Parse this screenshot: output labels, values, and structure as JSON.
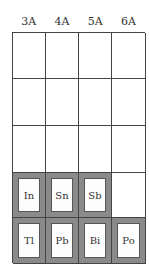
{
  "headers": [
    "3A",
    "4A",
    "5A",
    "6A"
  ],
  "rows": [
    [
      {
        "symbol": "",
        "shaded": false
      },
      {
        "symbol": "",
        "shaded": false
      },
      {
        "symbol": "",
        "shaded": false
      },
      {
        "symbol": "",
        "shaded": false
      }
    ],
    [
      {
        "symbol": "",
        "shaded": false
      },
      {
        "symbol": "",
        "shaded": false
      },
      {
        "symbol": "",
        "shaded": false
      },
      {
        "symbol": "",
        "shaded": false
      }
    ],
    [
      {
        "symbol": "",
        "shaded": false
      },
      {
        "symbol": "",
        "shaded": false
      },
      {
        "symbol": "",
        "shaded": false
      },
      {
        "symbol": "",
        "shaded": false
      }
    ],
    [
      {
        "symbol": "In",
        "shaded": true
      },
      {
        "symbol": "Sn",
        "shaded": true
      },
      {
        "symbol": "Sb",
        "shaded": true
      },
      {
        "symbol": "",
        "shaded": false
      }
    ],
    [
      {
        "symbol": "Tl",
        "shaded": true
      },
      {
        "symbol": "Pb",
        "shaded": true
      },
      {
        "symbol": "Bi",
        "shaded": true
      },
      {
        "symbol": "Po",
        "shaded": true
      }
    ]
  ],
  "colors": {
    "shade": "#8a8a8a",
    "grid_line": "#444444",
    "inner_box": "#fdfdfd"
  }
}
